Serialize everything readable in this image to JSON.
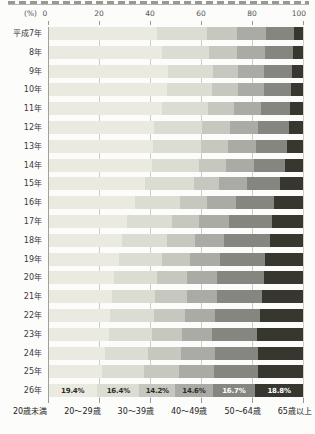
{
  "axis": {
    "unit_label": "(%)",
    "tick_labels": [
      "0",
      "20",
      "40",
      "60",
      "80",
      "100"
    ],
    "tick_values": [
      0,
      20,
      40,
      60,
      80,
      100
    ]
  },
  "chart_data": {
    "type": "bar",
    "stacked": true,
    "orientation": "horizontal",
    "xlabel": "(%)",
    "xlim": [
      0,
      100
    ],
    "grid": true,
    "legend_position": "bottom",
    "categories": [
      "平成7年",
      "8年",
      "9年",
      "10年",
      "11年",
      "12年",
      "13年",
      "14年",
      "15年",
      "16年",
      "17年",
      "18年",
      "19年",
      "20年",
      "21年",
      "22年",
      "23年",
      "24年",
      "25年",
      "26年"
    ],
    "series": [
      {
        "name": "20歳未満",
        "color": "#eaeae0",
        "values": [
          42.6,
          44.7,
          47.0,
          46.7,
          44.7,
          41.4,
          41.2,
          40.8,
          38.2,
          34.0,
          31.0,
          29.0,
          27.7,
          25.8,
          25.1,
          24.4,
          23.8,
          22.5,
          21.2,
          19.4
        ]
      },
      {
        "name": "20〜29歳",
        "color": "#dcddd2",
        "values": [
          19.6,
          18.6,
          17.6,
          17.8,
          18.0,
          19.0,
          18.8,
          18.3,
          18.9,
          17.6,
          17.6,
          17.7,
          17.0,
          16.9,
          17.0,
          17.0,
          17.0,
          16.8,
          16.6,
          16.4
        ]
      },
      {
        "name": "30〜39歳",
        "color": "#c6c7bf",
        "values": [
          11.8,
          10.8,
          10.0,
          10.0,
          10.4,
          10.8,
          10.4,
          10.6,
          10.0,
          10.8,
          10.5,
          11.1,
          11.1,
          11.8,
          12.4,
          12.5,
          11.7,
          13.0,
          13.6,
          14.2
        ]
      },
      {
        "name": "40〜49歳",
        "color": "#aaaba5",
        "values": [
          11.6,
          11.0,
          10.3,
          10.2,
          10.6,
          11.0,
          11.0,
          11.0,
          10.8,
          11.4,
          11.7,
          11.1,
          11.8,
          11.8,
          11.8,
          11.7,
          11.8,
          13.2,
          13.9,
          14.6
        ]
      },
      {
        "name": "50〜64歳",
        "color": "#85867f",
        "values": [
          10.8,
          11.0,
          10.8,
          10.8,
          11.4,
          12.2,
          12.4,
          12.4,
          13.0,
          15.0,
          17.0,
          18.3,
          17.6,
          18.3,
          17.6,
          17.7,
          17.7,
          17.0,
          16.9,
          16.7
        ]
      },
      {
        "name": "65歳以上",
        "color": "#37372f",
        "values": [
          3.6,
          3.9,
          4.3,
          4.5,
          4.9,
          5.6,
          6.2,
          6.9,
          9.1,
          11.2,
          12.2,
          12.8,
          14.8,
          15.4,
          16.1,
          16.7,
          18.0,
          17.5,
          17.8,
          18.8
        ]
      }
    ],
    "value_labels_row": "26年",
    "value_labels": [
      "19.4%",
      "16.4%",
      "14.2%",
      "14.6%",
      "16.7%",
      "18.8%"
    ],
    "value_label_text_colors": [
      "#2b2b28",
      "#2b2b28",
      "#2b2b28",
      "#2b2b28",
      "#ffffff",
      "#ffffff"
    ],
    "legend": [
      "20歳未満",
      "20〜29歳",
      "30〜39歳",
      "40〜49歳",
      "50〜64歳",
      "65歳以上"
    ]
  },
  "layout_colors": {
    "gridline": "#cecec8",
    "axis_line": "#a2a29b",
    "background": "#fcfcfa"
  }
}
